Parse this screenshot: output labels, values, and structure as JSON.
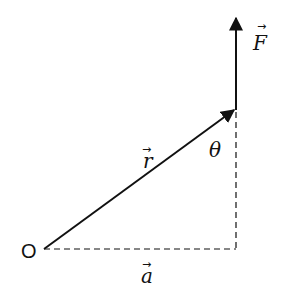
{
  "diagram": {
    "title": "",
    "points": {
      "origin": {
        "label": "O",
        "x": 44,
        "y": 249
      },
      "tip_r": {
        "x": 236,
        "y": 109
      },
      "tip_F": {
        "x": 236,
        "y": 17
      },
      "foot": {
        "x": 236,
        "y": 249
      }
    },
    "labels": {
      "origin": "O",
      "r_vector": "r",
      "F_vector": "F",
      "a_vector": "a",
      "angle": "θ",
      "vector_arrow": "→"
    },
    "edges": [
      {
        "name": "r-vector",
        "from": "origin",
        "to": "tip_r",
        "style": "solid",
        "arrow": true
      },
      {
        "name": "F-vector",
        "from": "tip_r",
        "to": "tip_F",
        "style": "solid",
        "arrow": true
      },
      {
        "name": "a-projection",
        "from": "origin",
        "to": "foot",
        "style": "dashed",
        "arrow": false
      },
      {
        "name": "vertical-projection",
        "from": "tip_r",
        "to": "foot",
        "style": "dashed",
        "arrow": false
      }
    ],
    "colors": {
      "stroke": "#111111",
      "background": "#ffffff"
    }
  }
}
